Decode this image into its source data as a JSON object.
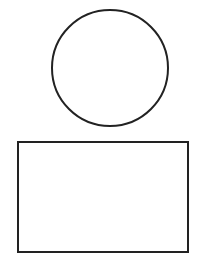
{
  "canvas": {
    "width": 201,
    "height": 256,
    "background": "#ffffff"
  },
  "shapes": [
    {
      "type": "circle",
      "name": "circle",
      "cx": 110,
      "cy": 68,
      "r": 58,
      "stroke": "#222222",
      "stroke_width": 2,
      "fill": "none"
    },
    {
      "type": "rectangle",
      "name": "rectangle",
      "x": 18,
      "y": 142,
      "width": 170,
      "height": 110,
      "stroke": "#222222",
      "stroke_width": 2,
      "fill": "none"
    }
  ]
}
